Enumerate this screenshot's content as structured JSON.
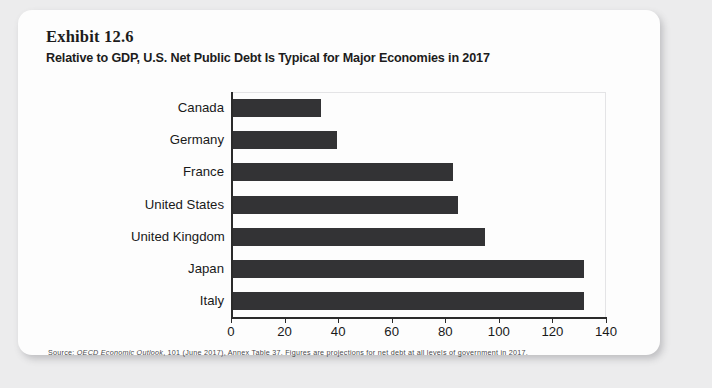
{
  "exhibit": {
    "number": "Exhibit 12.6",
    "title": "Relative to GDP, U.S. Net Public Debt Is Typical for Major Economies in 2017",
    "source_prefix": "Source: ",
    "source_italic": "OECD Economic Outlook",
    "source_rest": ", 101 (June 2017), Annex Table 37. Figures are projections for net debt at all levels of government in 2017."
  },
  "colors": {
    "bar": "#333335",
    "axis": "#2b2b2b",
    "card": "#fdfdfd",
    "page": "#ececed",
    "text": "#191919"
  },
  "chart_data": {
    "type": "bar",
    "orientation": "horizontal",
    "title": "Relative to GDP, U.S. Net Public Debt Is Typical for Major Economies in 2017",
    "xlabel": "",
    "ylabel": "",
    "categories": [
      "Canada",
      "Germany",
      "France",
      "United States",
      "United Kingdom",
      "Japan",
      "Italy"
    ],
    "values": [
      33,
      39,
      82,
      84,
      94,
      131,
      131
    ],
    "xlim": [
      0,
      140
    ],
    "xticks": [
      0,
      20,
      40,
      60,
      80,
      100,
      120,
      140
    ],
    "xtick_labels": [
      "0",
      "20",
      "40",
      "60",
      "80",
      "100",
      "120",
      "140"
    ],
    "grid": false,
    "legend": "none"
  }
}
